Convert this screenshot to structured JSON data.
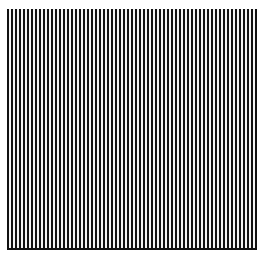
{
  "figure": {
    "type": "vertical-stripe-grating",
    "stripe_period_px": 4,
    "stripe_dark_width_px": 2,
    "stripe_light_width_px": 2,
    "colors": {
      "stripe_dark": "#111111",
      "stripe_light": "#f4f4f4",
      "background": "#ffffff"
    },
    "region": {
      "left": 7,
      "top": 9,
      "width": 250,
      "height": 239
    }
  }
}
